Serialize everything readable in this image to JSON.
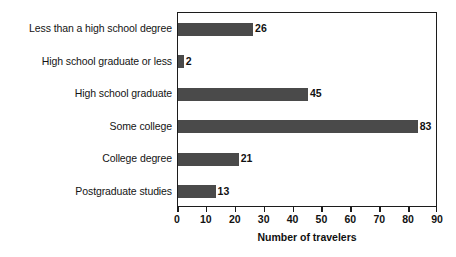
{
  "chart_data": {
    "type": "bar",
    "orientation": "horizontal",
    "title": "",
    "xlabel": "Number of travelers",
    "ylabel": "",
    "categories": [
      "Less than a high school degree",
      "High school graduate or less",
      "High school graduate",
      "Some college",
      "College degree",
      "Postgraduate studies"
    ],
    "values": [
      26,
      2,
      45,
      83,
      21,
      13
    ],
    "value_labels": [
      "26",
      "2",
      "45",
      "83",
      "21",
      "13"
    ],
    "xlim": [
      0,
      90
    ],
    "xticks": [
      0,
      10,
      20,
      30,
      40,
      50,
      60,
      70,
      80,
      90
    ],
    "xtick_labels": [
      "0",
      "10",
      "20",
      "30",
      "40",
      "50",
      "60",
      "70",
      "80",
      "90"
    ],
    "grid": false,
    "legend": false,
    "bar_color": "#4a4a4a",
    "axis_color": "#1c1c1c",
    "background": "#ffffff"
  }
}
